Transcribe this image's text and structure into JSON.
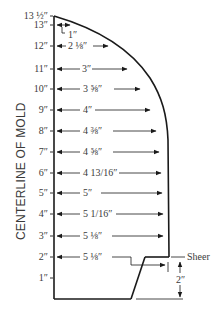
{
  "diagram": {
    "axis_label": "CENTERLINE OF MOLD",
    "sheer_label": "Sheer",
    "sheer_height_label": "2″",
    "colors": {
      "outline": "#1a1a1a",
      "text": "#3a3a3a",
      "background": "#ffffff"
    },
    "stations": [
      {
        "height": "13 ½″",
        "width": ""
      },
      {
        "height": "13″",
        "width": "1″"
      },
      {
        "height": "12″",
        "width": "2 ⅛″"
      },
      {
        "height": "11″",
        "width": "3″"
      },
      {
        "height": "10″",
        "width": "3 ⅝″"
      },
      {
        "height": "9″",
        "width": "4″"
      },
      {
        "height": "8″",
        "width": "4 ⅜″"
      },
      {
        "height": "7″",
        "width": "4 ⅝″"
      },
      {
        "height": "6″",
        "width": "4 13/16″"
      },
      {
        "height": "5″",
        "width": "5″"
      },
      {
        "height": "4″",
        "width": "5 1/16″"
      },
      {
        "height": "3″",
        "width": "5 ⅛″"
      },
      {
        "height": "2″",
        "width": "5 ⅛″"
      },
      {
        "height": "1″",
        "width": ""
      }
    ]
  }
}
